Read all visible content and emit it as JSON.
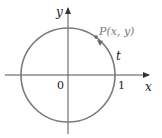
{
  "diagram": {
    "labels": {
      "x_axis": "x",
      "y_axis": "y",
      "origin": "0",
      "one": "1",
      "point": "P(x, y)",
      "arc": "t"
    },
    "colors": {
      "circle": "#7a7a7a",
      "axes": "#555555",
      "text": "#222222",
      "point_label": "#7a7a7a"
    }
  }
}
